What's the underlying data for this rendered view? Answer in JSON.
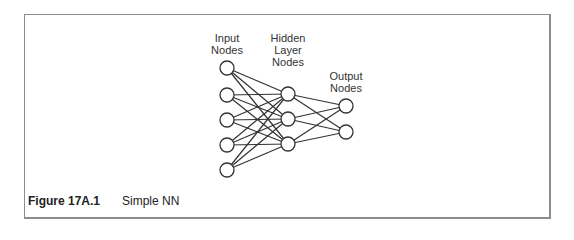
{
  "figure": {
    "number_label": "Figure 17A.1",
    "title": "Simple NN"
  },
  "layers": [
    {
      "name": "input",
      "label_line1": "Input",
      "label_line2": "Nodes",
      "label_line3": "",
      "x": 227,
      "node_ys": [
        68,
        95,
        120,
        145,
        170
      ]
    },
    {
      "name": "hidden",
      "label_line1": "Hidden",
      "label_line2": "Layer",
      "label_line3": "Nodes",
      "x": 288,
      "node_ys": [
        94,
        119,
        144
      ]
    },
    {
      "name": "output",
      "label_line1": "Output",
      "label_line2": "Nodes",
      "label_line3": "",
      "x": 346,
      "node_ys": [
        106,
        132
      ]
    }
  ],
  "style": {
    "node_radius": 7,
    "stroke": "#333333",
    "border": "#8c8c8c"
  }
}
